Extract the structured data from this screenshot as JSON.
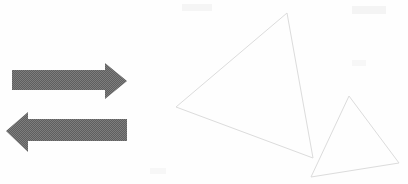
{
  "canvas": {
    "width": 408,
    "height": 184,
    "background_color": "#fefefe",
    "title": "Two gray block arrows and two overlapping outlined triangles"
  },
  "palette": {
    "arrow_fill": "#6a6a6a",
    "arrow_dither_light": "#8d8d8d",
    "arrow_dither_dark": "#555555",
    "triangle_stroke": "#dcdcdc",
    "smudge": "#f4f4f4",
    "background": "#fefefe"
  },
  "shapes": {
    "arrows": [
      {
        "name": "right-arrow",
        "direction": "right",
        "label": "",
        "fill": "#6a6a6a",
        "points": "12,70 105,70 105,63 127,81 105,99 105,90 12,90",
        "bbox": {
          "x": 12,
          "y": 63,
          "width": 115,
          "height": 36
        },
        "tip": {
          "x": 127,
          "y": 81
        },
        "shaft": {
          "x": 12,
          "y": 70,
          "width": 93,
          "height": 20
        }
      },
      {
        "name": "left-arrow",
        "direction": "left",
        "label": "",
        "fill": "#6a6a6a",
        "points": "127,119 28,119 28,112 6,131 28,152 28,141 127,141",
        "bbox": {
          "x": 6,
          "y": 112,
          "width": 121,
          "height": 40
        },
        "tip": {
          "x": 6,
          "y": 131
        },
        "shaft": {
          "x": 28,
          "y": 119,
          "width": 99,
          "height": 22
        }
      }
    ],
    "triangles": [
      {
        "name": "large-triangle",
        "stroke": "#dcdcdc",
        "stroke_width": 1,
        "fill": "none",
        "points": "287,13 176,107 313,158",
        "vertices": [
          {
            "x": 287,
            "y": 13
          },
          {
            "x": 176,
            "y": 107
          },
          {
            "x": 313,
            "y": 158
          }
        ]
      },
      {
        "name": "small-triangle",
        "stroke": "#dcdcdc",
        "stroke_width": 1,
        "fill": "none",
        "points": "349,96 311,177 399,163",
        "vertices": [
          {
            "x": 349,
            "y": 96
          },
          {
            "x": 311,
            "y": 177
          },
          {
            "x": 399,
            "y": 163
          }
        ]
      }
    ],
    "smudges": [
      {
        "name": "smudge-top-left",
        "x": 182,
        "y": 4,
        "width": 30,
        "height": 7
      },
      {
        "name": "smudge-top-right",
        "x": 352,
        "y": 6,
        "width": 34,
        "height": 8
      },
      {
        "name": "smudge-mid-right",
        "x": 352,
        "y": 60,
        "width": 14,
        "height": 6
      },
      {
        "name": "smudge-bottom-left",
        "x": 150,
        "y": 168,
        "width": 16,
        "height": 6
      }
    ]
  }
}
